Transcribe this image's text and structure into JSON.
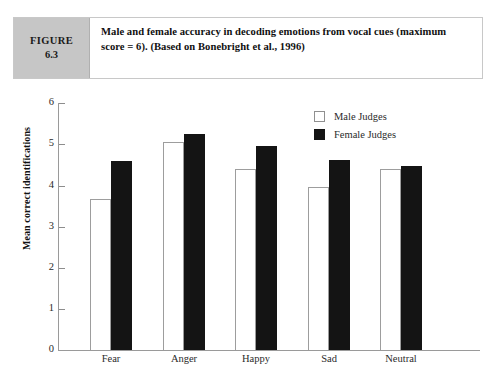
{
  "figure": {
    "label_word": "FIGURE",
    "label_number": "6.3",
    "caption": "Male and female accuracy in decoding emotions from vocal cues (maximum score = 6). (Based on Bonebright et al., 1996)"
  },
  "chart_data": {
    "type": "bar",
    "title": "",
    "xlabel": "",
    "ylabel": "Mean correct identifications",
    "categories": [
      "Fear",
      "Anger",
      "Happy",
      "Sad",
      "Neutral"
    ],
    "series": [
      {
        "name": "Male Judges",
        "color": "#ffffff",
        "values": [
          3.68,
          5.05,
          4.4,
          3.95,
          4.4
        ]
      },
      {
        "name": "Female Judges",
        "color": "#141414",
        "values": [
          4.6,
          5.25,
          4.95,
          4.62,
          4.48
        ]
      }
    ],
    "ylim": [
      0,
      6
    ],
    "y_ticks": [
      "0",
      "1",
      "2",
      "3",
      "4",
      "5",
      "6"
    ],
    "grid": false,
    "legend_position": "top-right"
  },
  "legend": {
    "items": [
      {
        "label": "Male Judges",
        "swatch": "open-square"
      },
      {
        "label": "Female Judges",
        "swatch": "filled-square"
      }
    ]
  }
}
